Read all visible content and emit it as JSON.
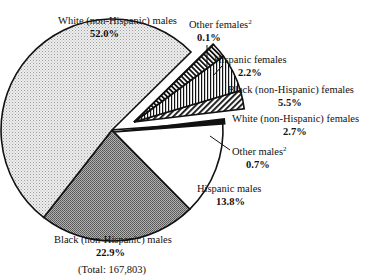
{
  "chart_data": {
    "type": "pie",
    "title": "",
    "total_label": "(Total: 167,803)",
    "slices": [
      {
        "label": "White (non-Hispanic) males",
        "sup": "",
        "value": 52.0,
        "value_label": "52.0%",
        "pattern": "fine-dots-light",
        "exploded": false
      },
      {
        "label": "Black (non-Hispanic) males",
        "sup": "",
        "value": 22.9,
        "value_label": "22.9%",
        "pattern": "dots-dark",
        "exploded": false
      },
      {
        "label": "Hispanic males",
        "sup": "",
        "value": 13.8,
        "value_label": "13.8%",
        "pattern": "white",
        "exploded": false
      },
      {
        "label": "Other males",
        "sup": "2",
        "value": 0.7,
        "value_label": "0.7%",
        "pattern": "black",
        "exploded": false
      },
      {
        "label": "White (non-Hispanic) females",
        "sup": "",
        "value": 2.7,
        "value_label": "2.7%",
        "pattern": "diagonal-hatch",
        "exploded": true
      },
      {
        "label": "Black (non-Hispanic) females",
        "sup": "",
        "value": 5.5,
        "value_label": "5.5%",
        "pattern": "vertical-lines",
        "exploded": true
      },
      {
        "label": "Hispanic females",
        "sup": "",
        "value": 2.2,
        "value_label": "2.2%",
        "pattern": "diagonal-hatch-dense",
        "exploded": true
      },
      {
        "label": "Other females",
        "sup": "2",
        "value": 0.1,
        "value_label": "0.1%",
        "pattern": "black",
        "exploded": true
      }
    ],
    "legend": "none (direct labels)"
  }
}
